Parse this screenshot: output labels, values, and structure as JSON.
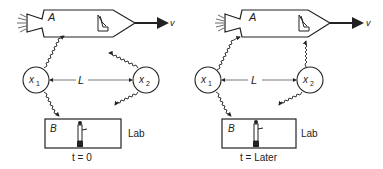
{
  "panels": [
    {
      "rocket_label": "A",
      "velocity_label": "v",
      "observer1_label": "x",
      "observer1_sub": "1",
      "observer2_label": "x",
      "observer2_sub": "2",
      "distance_label": "L",
      "lab_box_label": "B",
      "lab_label": "Lab",
      "time_caption": "t = 0"
    },
    {
      "rocket_label": "A",
      "velocity_label": "v",
      "observer1_label": "x",
      "observer1_sub": "1",
      "observer2_label": "x",
      "observer2_sub": "2",
      "distance_label": "L",
      "lab_box_label": "B",
      "lab_label": "Lab",
      "time_caption": "t = Later"
    }
  ],
  "colors": {
    "ink": "#222222",
    "background": "#ffffff"
  }
}
